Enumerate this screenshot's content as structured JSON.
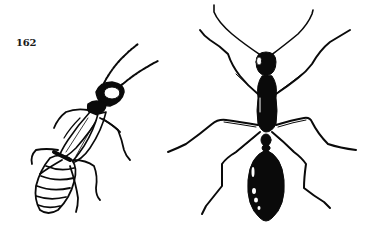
{
  "page": {
    "number": "162",
    "background": "#ffffff",
    "ink_color": "#0a0a0a"
  },
  "figures": [
    {
      "id": "left-insect",
      "subject": "termite-like insect, oblique dorsal view",
      "style": "pen-and-ink line drawing"
    },
    {
      "id": "right-insect",
      "subject": "ant, dorsal view with six legs and two antennae",
      "style": "pen-and-ink silhouette drawing"
    }
  ]
}
